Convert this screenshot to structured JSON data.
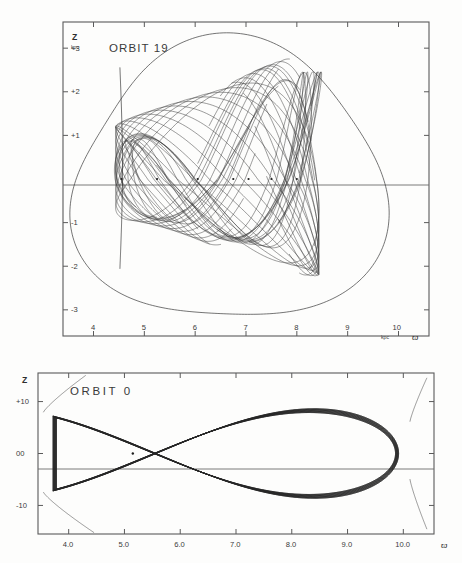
{
  "figure": {
    "background_color": "#fdfdfc",
    "line_color": "#3a3a3a",
    "axis_color": "#5a5a5a"
  },
  "panels": [
    {
      "id": "orbit-19",
      "title": "ORBIT 19",
      "y_axis_label": "Z",
      "y_axis_unit": "kpc",
      "x_axis_unit": "kpc",
      "x_axis_symbol": "ϖ",
      "y_ticks": [
        "+3",
        "+2",
        "+1",
        "-1",
        "-2",
        "-3"
      ],
      "x_ticks": [
        "4",
        "5",
        "6",
        "7",
        "8",
        "9",
        "10"
      ]
    },
    {
      "id": "orbit-0",
      "title": "ORBIT 0",
      "y_axis_label": "Z",
      "x_axis_symbol": "ϖ",
      "y_ticks": [
        "+10",
        "00",
        "-10"
      ],
      "x_ticks": [
        "4.0",
        "5.0",
        "6.0",
        "7.0",
        "8.0",
        "9.0",
        "10.0"
      ]
    }
  ],
  "chart_data": [
    {
      "type": "line",
      "id": "orbit-19",
      "title": "ORBIT 19",
      "xlabel": "ϖ (kpc)",
      "ylabel": "Z (kpc)",
      "xlim": [
        3.4,
        10.6
      ],
      "ylim": [
        -3.6,
        3.6
      ],
      "x_ticks": [
        4,
        5,
        6,
        7,
        8,
        9,
        10
      ],
      "x_tick_labels": [
        "4",
        "5",
        "6",
        "7",
        "8",
        "9",
        "10"
      ],
      "y_ticks": [
        3,
        2,
        1,
        -1,
        -2,
        -3
      ],
      "y_tick_labels": [
        "+3",
        "+2",
        "+1",
        "-1",
        "-2",
        "-3"
      ],
      "grid": false,
      "legend": "none",
      "annotations": [
        "kpc",
        "kpc",
        "ϖ"
      ],
      "description": "Meridional-plane box/tube orbit: densely crossing loops bounded by a rounded-triangular zero-velocity envelope.",
      "envelope": {
        "description": "outer zero-velocity curve",
        "r_min": 3.55,
        "r_max": 9.55,
        "z_max": 3.15,
        "z_min": -3.35
      },
      "orbit_band": {
        "r_inner": 4.5,
        "r_outer": 8.35,
        "z_top": 2.85,
        "z_bottom": -2.1
      },
      "series": [
        {
          "name": "orbit loops",
          "loop_count": 13,
          "r_pericenter": 4.52,
          "r_apocenter": 8.35,
          "z_amplitude_top": 2.85,
          "z_amplitude_bottom": -2.05
        }
      ],
      "markers": [
        {
          "r": 4.55,
          "z": 0.0
        },
        {
          "r": 5.25,
          "z": 0.0
        },
        {
          "r": 6.05,
          "z": 0.0
        },
        {
          "r": 6.75,
          "z": 0.0
        },
        {
          "r": 7.05,
          "z": 0.0
        },
        {
          "r": 7.5,
          "z": 0.0
        },
        {
          "r": 8.0,
          "z": 0.0
        }
      ]
    },
    {
      "type": "line",
      "id": "orbit-0",
      "title": "ORBIT 0",
      "xlabel": "ϖ",
      "ylabel": "Z",
      "xlim": [
        3.45,
        10.55
      ],
      "ylim": [
        -15.5,
        15.5
      ],
      "x_ticks": [
        4.0,
        5.0,
        6.0,
        7.0,
        8.0,
        9.0,
        10.0
      ],
      "x_tick_labels": [
        "4.0",
        "5.0",
        "6.0",
        "7.0",
        "8.0",
        "9.0",
        "10.0"
      ],
      "y_ticks": [
        10,
        0,
        -10
      ],
      "y_tick_labels": [
        "+10",
        "00",
        "-10"
      ],
      "grid": false,
      "legend": "none",
      "description": "Thin fish-shaped loop orbit: a bundle of near-degenerate orbits crossing near r=4.7 and closing at apocenter r=9.9, with short envelope arcs at both ends.",
      "orbit_band": {
        "r_crossing": 4.72,
        "r_apocenter": 9.9,
        "r_pericenter": 3.72,
        "z_max": 11.0,
        "z_min": -11.0
      },
      "series": [
        {
          "name": "orbit bundle",
          "loop_count": 7,
          "z_amplitude": 11.0,
          "r_min": 3.72,
          "r_max": 9.9
        }
      ],
      "markers": [
        {
          "r": 5.15,
          "z": 0.0
        }
      ],
      "envelope_arcs": [
        {
          "side": "left-top",
          "r_from": 3.55,
          "r_to": 4.3,
          "z_from": 8.0,
          "z_to": 15.0
        },
        {
          "side": "left-bottom",
          "r_from": 3.55,
          "r_to": 4.45,
          "z_from": -7.5,
          "z_to": -15.2
        },
        {
          "side": "right-top",
          "r_from": 10.12,
          "r_to": 10.42,
          "z_from": 6.2,
          "z_to": 14.5
        },
        {
          "side": "right-bottom",
          "r_from": 10.12,
          "r_to": 10.42,
          "z_from": -5.0,
          "z_to": -14.5
        }
      ]
    }
  ]
}
